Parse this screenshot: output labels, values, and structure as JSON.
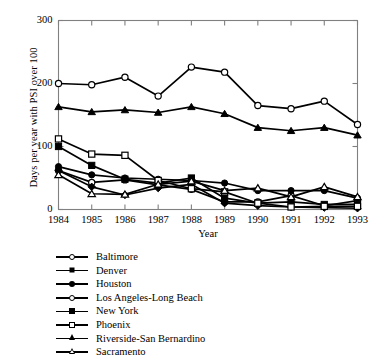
{
  "chart_data": {
    "type": "line",
    "title": "",
    "xlabel": "Year",
    "ylabel": "Days per year with PSI over 100",
    "x": [
      1984,
      1985,
      1986,
      1987,
      1988,
      1989,
      1990,
      1991,
      1992,
      1993
    ],
    "xtick_labels": [
      "1984",
      "1985",
      "1986",
      "1987",
      "1988",
      "1989",
      "1990",
      "1991",
      "1992",
      "1993"
    ],
    "ytick_labels": [
      "0",
      "100",
      "200",
      "300"
    ],
    "ytick_values": [
      0,
      100,
      200,
      300
    ],
    "ylim": [
      0,
      300
    ],
    "xlim": [
      1984,
      1993
    ],
    "grid": false,
    "legend_position": "below",
    "series": [
      {
        "name": "Baltimore",
        "marker": "circle-open",
        "values": [
          62,
          43,
          47,
          39,
          32,
          12,
          12,
          22,
          6,
          14
        ]
      },
      {
        "name": "Denver",
        "marker": "diamond-fill",
        "values": [
          62,
          36,
          23,
          34,
          40,
          10,
          6,
          4,
          3,
          2
        ]
      },
      {
        "name": "Houston",
        "marker": "circle-fill",
        "values": [
          68,
          55,
          50,
          48,
          46,
          42,
          30,
          30,
          30,
          18
        ]
      },
      {
        "name": "Los Angeles-Long Beach",
        "marker": "circle-open",
        "values": [
          200,
          198,
          210,
          180,
          226,
          218,
          165,
          160,
          172,
          135
        ]
      },
      {
        "name": "New York",
        "marker": "square-fill",
        "values": [
          100,
          70,
          48,
          42,
          50,
          18,
          10,
          12,
          8,
          8
        ]
      },
      {
        "name": "Phoenix",
        "marker": "square-open",
        "values": [
          112,
          88,
          86,
          46,
          33,
          28,
          10,
          4,
          5,
          5
        ]
      },
      {
        "name": "Riverside-San Bernardino",
        "marker": "tri-fill",
        "values": [
          163,
          155,
          158,
          154,
          163,
          152,
          130,
          125,
          130,
          118
        ]
      },
      {
        "name": "Sacramento",
        "marker": "tri-open",
        "values": [
          55,
          25,
          24,
          40,
          45,
          30,
          34,
          20,
          36,
          20
        ]
      }
    ]
  },
  "legend": {
    "entries": [
      {
        "label": "Baltimore",
        "marker": "circle-open"
      },
      {
        "label": "Denver",
        "marker": "diamond-fill"
      },
      {
        "label": "Houston",
        "marker": "circle-fill"
      },
      {
        "label": "Los Angeles-Long Beach",
        "marker": "circle-open"
      },
      {
        "label": "New York",
        "marker": "square-fill"
      },
      {
        "label": "Phoenix",
        "marker": "square-open"
      },
      {
        "label": "Riverside-San Bernardino",
        "marker": "tri-fill"
      },
      {
        "label": "Sacramento",
        "marker": "tri-open"
      }
    ]
  },
  "style": {
    "line_color": "#000000",
    "axis_color": "#808080",
    "background": "#ffffff"
  }
}
